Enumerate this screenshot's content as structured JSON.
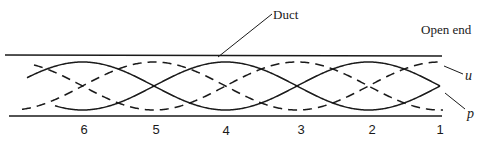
{
  "figure": {
    "labels": {
      "duct": "Duct",
      "open_end": "Open end",
      "u": "u",
      "p": "p"
    },
    "positions": [
      "6",
      "5",
      "4",
      "3",
      "2",
      "1"
    ],
    "geometry": {
      "duct_top_y": 55,
      "duct_bottom_y": 116,
      "center_y": 86,
      "amplitude": 24,
      "open_end_x": 440,
      "half_wavelength": 143,
      "curve_start_x": 27,
      "position_x": [
        84,
        155,
        226,
        298,
        369,
        440
      ]
    },
    "colors": {
      "line": "#1a1a1a",
      "background": "#ffffff"
    },
    "legend": {
      "u": "dashed curve (particle velocity, antinode at open end)",
      "p": "solid curve (pressure, node at open end)"
    }
  }
}
